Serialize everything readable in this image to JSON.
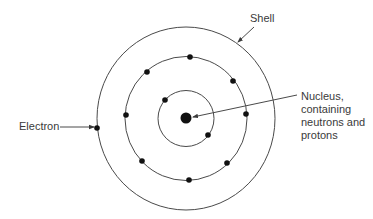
{
  "diagram": {
    "labels": {
      "shell": "Shell",
      "electron": "Electron",
      "nucleus_lines": [
        "Nucleus,",
        "containing",
        "neutrons and",
        "protons"
      ]
    },
    "colors": {
      "line": "#4a4a4a",
      "dot": "#111111",
      "text": "#3a3a3a",
      "background": "#ffffff"
    },
    "center": [
      186,
      118.5
    ],
    "nucleus": {
      "cx": 186,
      "cy": 118,
      "r": 5.5
    },
    "shells": [
      {
        "name": "inner",
        "rx": 28,
        "ry": 28,
        "electrons": [
          [
            165,
            100
          ],
          [
            208,
            135
          ]
        ]
      },
      {
        "name": "middle",
        "rx": 61,
        "ry": 62,
        "electrons": [
          [
            190,
            57
          ],
          [
            147,
            72
          ],
          [
            233,
            81
          ],
          [
            126,
            115
          ],
          [
            246,
            114
          ],
          [
            142,
            161
          ],
          [
            227,
            163
          ],
          [
            189,
            180
          ]
        ]
      },
      {
        "name": "outer",
        "rx": 89,
        "ry": 91.5,
        "electrons": [
          [
            97,
            128
          ]
        ]
      }
    ],
    "arrows": [
      {
        "name": "shell-arrow",
        "from": [
          254,
          27
        ],
        "to": [
          238,
          42
        ]
      },
      {
        "name": "electron-arrow",
        "from": [
          60,
          127
        ],
        "to": [
          94,
          127
        ]
      },
      {
        "name": "nucleus-arrow",
        "from": [
          297,
          95
        ],
        "to": [
          193,
          117
        ]
      }
    ]
  }
}
